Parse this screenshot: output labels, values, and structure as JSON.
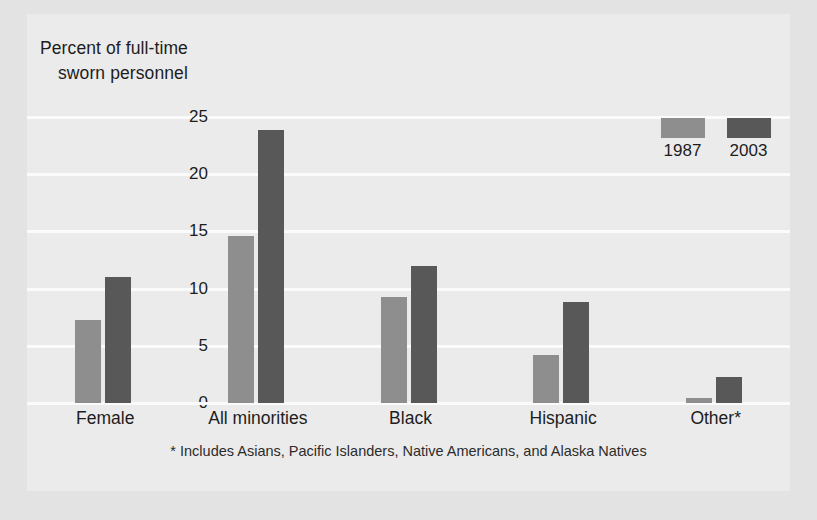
{
  "chart_data": {
    "type": "bar",
    "title": "",
    "subtitle": "",
    "ylabel_line1": "Percent of full-time",
    "ylabel_line2": "sworn personnel",
    "xlabel": "",
    "ylim": [
      0,
      25
    ],
    "yticks": [
      25,
      20,
      15,
      10,
      5,
      0
    ],
    "grid": true,
    "legend_position": "top-right",
    "categories": [
      "Female",
      "All minorities",
      "Black",
      "Hispanic",
      "Other*"
    ],
    "series": [
      {
        "name": "1987",
        "color": "#8e8e8e",
        "values": [
          7.3,
          14.6,
          9.3,
          4.2,
          0.4
        ]
      },
      {
        "name": "2003",
        "color": "#585858",
        "values": [
          11.0,
          23.9,
          12.0,
          8.8,
          2.3
        ]
      }
    ],
    "annotations": [
      "* Includes Asians, Pacific Islanders, Native Americans, and Alaska Natives"
    ],
    "footnote": "* Includes Asians, Pacific Islanders, Native Americans, and Alaska Natives"
  },
  "colors": {
    "background": "#e3e3e3",
    "panel": "#ebebeb",
    "gridline": "#fbfbfb",
    "series_1987": "#8e8e8e",
    "series_2003": "#585858",
    "text": "#1d1d1d"
  }
}
